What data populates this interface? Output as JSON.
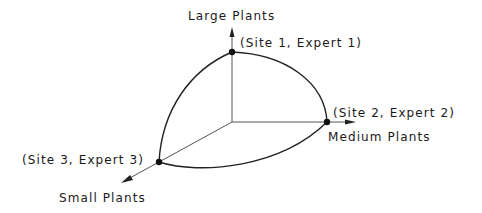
{
  "diagram": {
    "axes": {
      "vertical": {
        "label": "Large Plants"
      },
      "horizontal": {
        "label": "Medium Plants"
      },
      "diagonal": {
        "label": "Small Plants"
      }
    },
    "points": [
      {
        "label": "(Site 1, Expert 1)",
        "axis": "Large Plants"
      },
      {
        "label": "(Site 2, Expert 2)",
        "axis": "Medium Plants"
      },
      {
        "label": "(Site 3, Expert 3)",
        "axis": "Small Plants"
      }
    ],
    "colors": {
      "line": "#222222",
      "axis": "#555555",
      "background": "#ffffff"
    }
  }
}
